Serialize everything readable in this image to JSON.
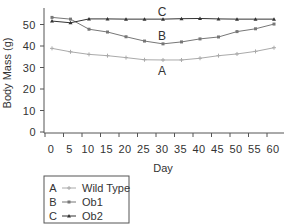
{
  "chart_data": {
    "type": "line",
    "title": "",
    "xlabel": "Day",
    "ylabel": "Body Mass (g)",
    "x": [
      0,
      5,
      10,
      15,
      20,
      25,
      30,
      35,
      40,
      45,
      50,
      55,
      60
    ],
    "xticks": [
      "0",
      "5",
      "10",
      "15",
      "20",
      "25",
      "30",
      "35",
      "40",
      "45",
      "50",
      "55",
      "60"
    ],
    "yticks": [
      "0",
      "10",
      "20",
      "30",
      "40",
      "50"
    ],
    "ylim": [
      0,
      56
    ],
    "xlim": [
      0,
      60
    ],
    "grid": false,
    "legend_position": "bottom-left, below axis",
    "series": [
      {
        "key": "A",
        "name": "Wild Type",
        "color": "#aaaaaa",
        "marker": "plus",
        "values": [
          38.9,
          37.3,
          36.1,
          35.5,
          34.6,
          33.6,
          33.5,
          33.5,
          34.3,
          35.5,
          36.3,
          37.5,
          39.2
        ]
      },
      {
        "key": "B",
        "name": "Ob1",
        "color": "#777777",
        "marker": "square",
        "values": [
          53.3,
          52.5,
          47.8,
          46.5,
          44.3,
          42.3,
          41.0,
          41.9,
          43.3,
          44.2,
          46.7,
          48.0,
          50.2
        ]
      },
      {
        "key": "C",
        "name": "Ob2",
        "color": "#333333",
        "marker": "triangle",
        "values": [
          51.6,
          50.8,
          52.6,
          52.6,
          52.5,
          52.5,
          52.5,
          52.7,
          52.8,
          52.6,
          52.5,
          52.5,
          52.5
        ]
      }
    ],
    "annotations": [
      {
        "text": "C",
        "x": 30,
        "y": 56
      },
      {
        "text": "B",
        "x": 30,
        "y": 45
      },
      {
        "text": "A",
        "x": 30,
        "y": 28
      }
    ]
  },
  "legend": {
    "entries": [
      {
        "key": "A",
        "label": "Wild Type"
      },
      {
        "key": "B",
        "label": "Ob1"
      },
      {
        "key": "C",
        "label": "Ob2"
      }
    ]
  }
}
